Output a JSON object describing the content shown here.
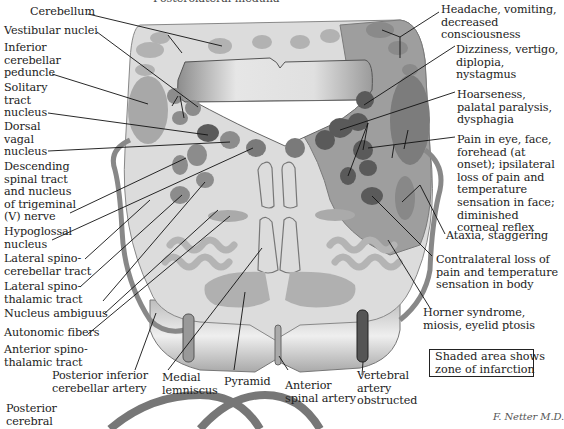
{
  "figure": {
    "title_partial": "Posterolateral medulla",
    "note_box": "Shaded area shows\nzone of infarction",
    "signature": "F. Netter M.D."
  },
  "left_labels": [
    {
      "id": "cerebellum",
      "text": "Cerebellum"
    },
    {
      "id": "vestibular-nuclei",
      "text": "Vestibular nuclei"
    },
    {
      "id": "inferior-cerebellar-peduncle",
      "text": "Inferior\ncerebellar\npeduncle"
    },
    {
      "id": "solitary-tract-nucleus",
      "text": "Solitary\ntract\nnucleus"
    },
    {
      "id": "dorsal-vagal-nucleus",
      "text": "Dorsal\nvagal\nnucleus"
    },
    {
      "id": "descending-spinal-tract",
      "text": "Descending\nspinal tract\nand nucleus\nof trigeminal\n(V) nerve"
    },
    {
      "id": "hypoglossal-nucleus",
      "text": "Hypoglossal\nnucleus"
    },
    {
      "id": "lateral-spinocerebellar-tract",
      "text": "Lateral spino-\ncerebellar tract"
    },
    {
      "id": "lateral-spinothalamic-tract",
      "text": "Lateral spino-\nthalamic tract"
    },
    {
      "id": "nucleus-ambiguus",
      "text": "Nucleus ambiguus"
    },
    {
      "id": "autonomic-fibers",
      "text": "Autonomic fibers"
    },
    {
      "id": "anterior-spinothalamic-tract",
      "text": "Anterior spino-\nthalamic tract"
    },
    {
      "id": "posterior-cerebral",
      "text": "Posterior\ncerebral"
    }
  ],
  "bottom_labels": [
    {
      "id": "pica",
      "text": "Posterior inferior\ncerebellar artery"
    },
    {
      "id": "medial-lemniscus",
      "text": "Medial\nlemniscus"
    },
    {
      "id": "pyramid",
      "text": "Pyramid"
    },
    {
      "id": "anterior-spinal-artery",
      "text": "Anterior\nspinal artery"
    },
    {
      "id": "vertebral-artery",
      "text": "Vertebral\nartery\nobstructed"
    }
  ],
  "right_labels": [
    {
      "id": "headache",
      "text": "Headache, vomiting,\ndecreased\nconsciousness"
    },
    {
      "id": "dizziness",
      "text": "Dizziness, vertigo,\ndiplopia,\nnystagmus"
    },
    {
      "id": "hoarseness",
      "text": "Hoarseness,\npalatal paralysis,\ndysphagia"
    },
    {
      "id": "pain-eye",
      "text": "Pain in eye, face,\nforehead (at\nonset); ipsilateral\nloss of pain and\ntemperature\nsensation in face;\ndiminished\ncorneal reflex"
    },
    {
      "id": "ataxia",
      "text": "Ataxia, staggering"
    },
    {
      "id": "contralateral",
      "text": "Contralateral loss of\npain and temperature\nsensation in body"
    },
    {
      "id": "horner",
      "text": "Horner syndrome,\nmiosis, eyelid ptosis"
    }
  ],
  "colors": {
    "tissue": "#d9d9d9",
    "infarct": "#9a9a9a",
    "nucleus": "#7c7c7c",
    "nucleus_dark": "#4e4e4e",
    "vessel": "#8a8a8a",
    "line": "#111111"
  }
}
